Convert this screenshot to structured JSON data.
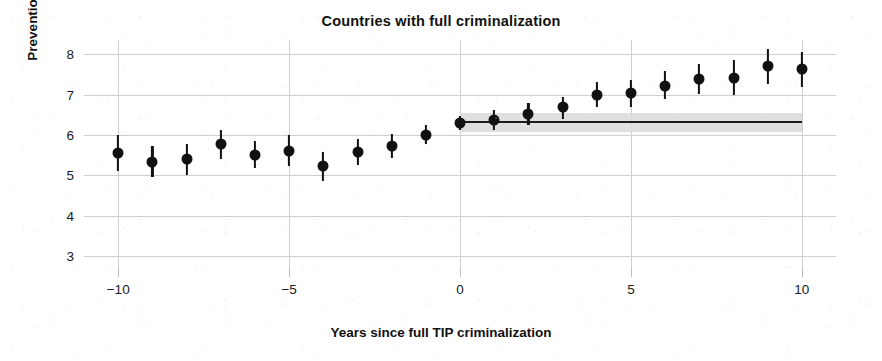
{
  "chart_data": {
    "type": "scatter",
    "title": "Countries with full criminalization",
    "xlabel": "Years since full TIP criminalization",
    "ylabel": "Prevention and protection indexes",
    "xlim": [
      -11,
      11
    ],
    "ylim": [
      2.7,
      8.35
    ],
    "grid": true,
    "legend": "none",
    "x_ticks": [
      -10,
      -5,
      0,
      5,
      10
    ],
    "x_tick_labels": [
      "−10",
      "−5",
      "0",
      "5",
      "10"
    ],
    "y_ticks": [
      3,
      4,
      5,
      6,
      7,
      8
    ],
    "y_tick_labels": [
      "3",
      "4",
      "5",
      "6",
      "7",
      "8"
    ],
    "marker": "filled-circle",
    "error_bars": "vertical-95ci",
    "x": [
      -10,
      -9,
      -8,
      -7,
      -6,
      -5,
      -4,
      -3,
      -2,
      -1,
      0,
      1,
      2,
      3,
      4,
      5,
      6,
      7,
      8,
      9,
      10
    ],
    "values": [
      5.55,
      5.33,
      5.4,
      5.78,
      5.5,
      5.6,
      5.22,
      5.57,
      5.72,
      6.0,
      6.3,
      6.37,
      6.52,
      6.68,
      7.0,
      7.03,
      7.22,
      7.38,
      7.42,
      7.7,
      7.63
    ],
    "ci_low": [
      5.1,
      4.95,
      5.0,
      5.4,
      5.18,
      5.22,
      4.85,
      5.25,
      5.42,
      5.76,
      6.12,
      6.12,
      6.25,
      6.4,
      6.68,
      6.7,
      6.88,
      7.0,
      6.98,
      7.25,
      7.18
    ],
    "ci_high": [
      6.0,
      5.72,
      5.78,
      6.12,
      5.85,
      6.0,
      5.58,
      5.9,
      6.02,
      6.25,
      6.48,
      6.62,
      6.8,
      6.95,
      7.32,
      7.36,
      7.58,
      7.75,
      7.85,
      8.12,
      8.05
    ],
    "reference_band": {
      "label": "counterfactual confidence band",
      "x_start": 0,
      "x_end": 10,
      "y_low": 6.08,
      "y_high": 6.55,
      "y_line": 6.32,
      "band_color": "#d9d9d9",
      "line_color": "#1c1c1c"
    },
    "colors": {
      "marker": "#111111",
      "grid": "#cfcfcf",
      "background": "#ffffff",
      "text": "#111111"
    }
  }
}
